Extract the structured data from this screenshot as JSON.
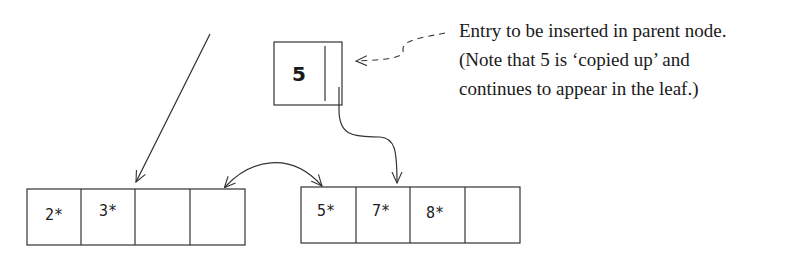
{
  "parent_entry": {
    "key": "5"
  },
  "annotation": {
    "lines": [
      "Entry to be inserted in parent node.",
      "(Note that 5 is ‘copied up’ and",
      "continues to appear in the leaf.)"
    ]
  },
  "left_leaf": {
    "cells": [
      "2*",
      "3*",
      "",
      ""
    ]
  },
  "right_leaf": {
    "cells": [
      "5*",
      "7*",
      "8*",
      ""
    ]
  },
  "colors": {
    "stroke": "#333333",
    "text": "#1a1a1a",
    "background": "#ffffff"
  }
}
